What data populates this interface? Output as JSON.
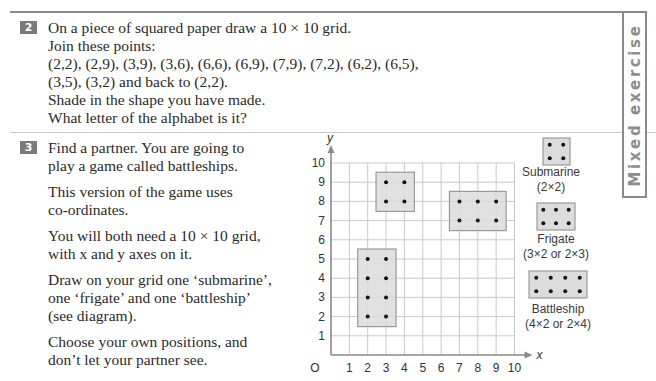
{
  "side_tab": {
    "label": "Mixed exercise",
    "color": "#8c8c8c"
  },
  "exercise2": {
    "number": "2",
    "lines": [
      "On a piece of squared paper draw a 10 × 10 grid.",
      "Join these points:",
      "(2,2), (2,9), (3,9), (3,6), (6,6), (6,9), (7,9), (7,2), (6,2), (6,5),",
      "(3,5), (3,2) and back to (2,2).",
      "Shade in the shape you have made.",
      "What letter of the alphabet is it?"
    ]
  },
  "exercise3": {
    "number": "3",
    "paragraphs": [
      [
        "Find a partner. You are going to",
        "play a game called battleships."
      ],
      [
        "This version of the game uses",
        "co-ordinates."
      ],
      [
        "You will both need a 10 × 10 grid,",
        "with x and y axes on it."
      ],
      [
        "Draw on your grid one ‘submarine’,",
        "one ‘frigate’ and one ‘battleship’",
        "(see diagram)."
      ],
      [
        "Choose your own positions, and",
        "don’t let your partner see."
      ]
    ]
  },
  "chart_data": {
    "type": "scatter",
    "title": "",
    "xlabel": "x",
    "ylabel": "y",
    "origin_label": "O",
    "xlim": [
      0,
      10
    ],
    "ylim": [
      0,
      10
    ],
    "x_ticks": [
      "1",
      "2",
      "3",
      "4",
      "5",
      "6",
      "7",
      "8",
      "9",
      "10"
    ],
    "y_ticks": [
      "1",
      "2",
      "3",
      "4",
      "5",
      "6",
      "7",
      "8",
      "9",
      "10"
    ],
    "grid": true,
    "ships": [
      {
        "name": "Submarine",
        "points": [
          [
            3,
            9
          ],
          [
            4,
            9
          ],
          [
            3,
            8
          ],
          [
            4,
            8
          ]
        ]
      },
      {
        "name": "Frigate",
        "points": [
          [
            7,
            8
          ],
          [
            8,
            8
          ],
          [
            9,
            8
          ],
          [
            7,
            7
          ],
          [
            8,
            7
          ],
          [
            9,
            7
          ]
        ]
      },
      {
        "name": "Battleship",
        "points": [
          [
            2,
            5
          ],
          [
            3,
            5
          ],
          [
            2,
            4
          ],
          [
            3,
            4
          ],
          [
            2,
            3
          ],
          [
            3,
            3
          ],
          [
            2,
            2
          ],
          [
            3,
            2
          ]
        ]
      }
    ],
    "legend": [
      {
        "name": "Submarine",
        "size": "(2×2)"
      },
      {
        "name": "Frigate",
        "size": "(3×2 or 2×3)"
      },
      {
        "name": "Battleship",
        "size": "(4×2 or 2×4)"
      }
    ]
  }
}
